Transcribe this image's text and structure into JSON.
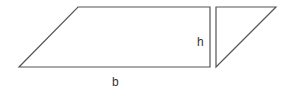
{
  "diagram": {
    "stroke_color": "#555555",
    "labels": {
      "height": "h",
      "base": "b"
    },
    "shapes": [
      {
        "name": "parallelogram-portion",
        "points": "19,67 78,7 210,7 210,67"
      },
      {
        "name": "cut-triangle",
        "points": "216,7 276,7 216,67"
      }
    ]
  }
}
